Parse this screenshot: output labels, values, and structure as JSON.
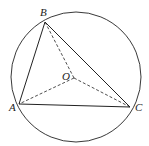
{
  "diagram": {
    "type": "geometry",
    "colors": {
      "stroke": "#222222",
      "background": "#ffffff"
    },
    "circle": {
      "center_label": "O",
      "cx": 76,
      "cy": 77,
      "r": 65
    },
    "points": [
      {
        "label": "A",
        "x": 19,
        "y": 104
      },
      {
        "label": "B",
        "x": 45,
        "y": 22
      },
      {
        "label": "C",
        "x": 130,
        "y": 107
      },
      {
        "label": "O",
        "x": 74,
        "y": 78
      }
    ],
    "solid_segments": [
      "AB",
      "BC",
      "CA"
    ],
    "dashed_segments": [
      "OA",
      "OB",
      "OC"
    ],
    "labels": {
      "A": "A",
      "B": "B",
      "C": "C",
      "O": "O"
    }
  }
}
